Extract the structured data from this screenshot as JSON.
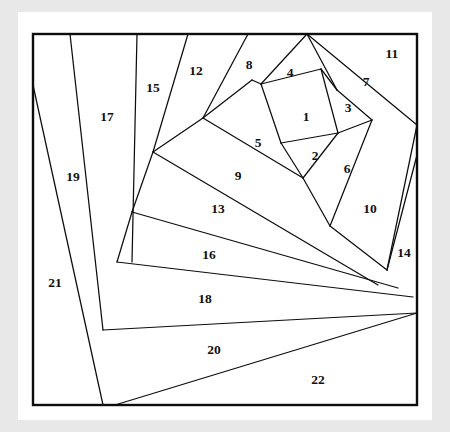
{
  "figure": {
    "background_color": "#e8e8e8",
    "paper_color": "#ffffff",
    "line_color": "#0d0d0d",
    "label_color": "#111111"
  },
  "chart_data": {
    "type": "diagram",
    "region_count": 22,
    "frame": {
      "x": 33,
      "y": 34,
      "width": 384,
      "height": 371
    },
    "labels": [
      {
        "id": "1",
        "text": "1",
        "x": 306,
        "y": 118
      },
      {
        "id": "2",
        "text": "2",
        "x": 315,
        "y": 157
      },
      {
        "id": "3",
        "text": "3",
        "x": 348,
        "y": 109
      },
      {
        "id": "4",
        "text": "4",
        "x": 290,
        "y": 74
      },
      {
        "id": "5",
        "text": "5",
        "x": 258,
        "y": 144
      },
      {
        "id": "6",
        "text": "6",
        "x": 347,
        "y": 170
      },
      {
        "id": "7",
        "text": "7",
        "x": 366,
        "y": 83
      },
      {
        "id": "8",
        "text": "8",
        "x": 249,
        "y": 66
      },
      {
        "id": "9",
        "text": "9",
        "x": 238,
        "y": 177
      },
      {
        "id": "10",
        "text": "10",
        "x": 370,
        "y": 210
      },
      {
        "id": "11",
        "text": "11",
        "x": 392,
        "y": 55
      },
      {
        "id": "12",
        "text": "12",
        "x": 196,
        "y": 72
      },
      {
        "id": "13",
        "text": "13",
        "x": 218,
        "y": 210
      },
      {
        "id": "14",
        "text": "14",
        "x": 404,
        "y": 254
      },
      {
        "id": "15",
        "text": "15",
        "x": 153,
        "y": 89
      },
      {
        "id": "16",
        "text": "16",
        "x": 209,
        "y": 256
      },
      {
        "id": "17",
        "text": "17",
        "x": 107,
        "y": 118
      },
      {
        "id": "18",
        "text": "18",
        "x": 205,
        "y": 300
      },
      {
        "id": "19",
        "text": "19",
        "x": 73,
        "y": 178
      },
      {
        "id": "20",
        "text": "20",
        "x": 214,
        "y": 351
      },
      {
        "id": "21",
        "text": "21",
        "x": 55,
        "y": 284
      },
      {
        "id": "22",
        "text": "22",
        "x": 318,
        "y": 381
      }
    ],
    "cut_lines": [
      {
        "name": "cut-17-19",
        "points": "70,34 103,330"
      },
      {
        "name": "cut-15-17",
        "points": "137,34 132,262"
      },
      {
        "name": "cut-12-15",
        "points": "188,34 153,152"
      },
      {
        "name": "cut-8-12",
        "points": "248,34 203,118"
      },
      {
        "name": "cut-4-8",
        "points": "307,34 261,84"
      },
      {
        "name": "cut-7-11",
        "points": "307,34 417,125"
      },
      {
        "name": "cut-4-7-inner",
        "points": "307,34 337,90"
      },
      {
        "name": "cut-1-4-top",
        "points": "261,84 321,69"
      },
      {
        "name": "cut-4-3",
        "points": "321,69 337,90"
      },
      {
        "name": "cut-1-3",
        "points": "321,69 338,133"
      },
      {
        "name": "cut-3-6-outer",
        "points": "337,90 372,120"
      },
      {
        "name": "cut-3-6",
        "points": "338,133 372,120"
      },
      {
        "name": "cut-1-5",
        "points": "261,84 281,143"
      },
      {
        "name": "cut-1-2",
        "points": "281,143 338,133"
      },
      {
        "name": "cut-2-5",
        "points": "281,143 303,178"
      },
      {
        "name": "cut-2-6",
        "points": "303,178 338,133"
      },
      {
        "name": "cut-5-9",
        "points": "203,118 303,178"
      },
      {
        "name": "cut-5-8-left",
        "points": "203,118 252,80"
      },
      {
        "name": "cut-8-left-edge",
        "points": "252,80 261,84"
      },
      {
        "name": "cut-9-6-10",
        "points": "303,178 330,226"
      },
      {
        "name": "cut-6-10",
        "points": "372,120 330,226"
      },
      {
        "name": "cut-10-14",
        "points": "417,125 387,270"
      },
      {
        "name": "cut-10-bottom",
        "points": "330,226 387,270"
      },
      {
        "name": "cut-9-13",
        "points": "153,152 378,285"
      },
      {
        "name": "cut-12-9-left",
        "points": "153,152 203,118"
      },
      {
        "name": "cut-13-16",
        "points": "132,212 398,288"
      },
      {
        "name": "cut-15-13-left",
        "points": "132,212 153,152"
      },
      {
        "name": "cut-16-18",
        "points": "117,262 413,297"
      },
      {
        "name": "cut-17-16-left",
        "points": "117,262 132,212"
      },
      {
        "name": "cut-18-20",
        "points": "103,330 417,313"
      },
      {
        "name": "cut-19-21",
        "points": "33,85 103,405"
      },
      {
        "name": "cut-20-22",
        "points": "115,405 417,313"
      },
      {
        "name": "cut-14-top",
        "points": "417,155 387,270"
      }
    ]
  }
}
